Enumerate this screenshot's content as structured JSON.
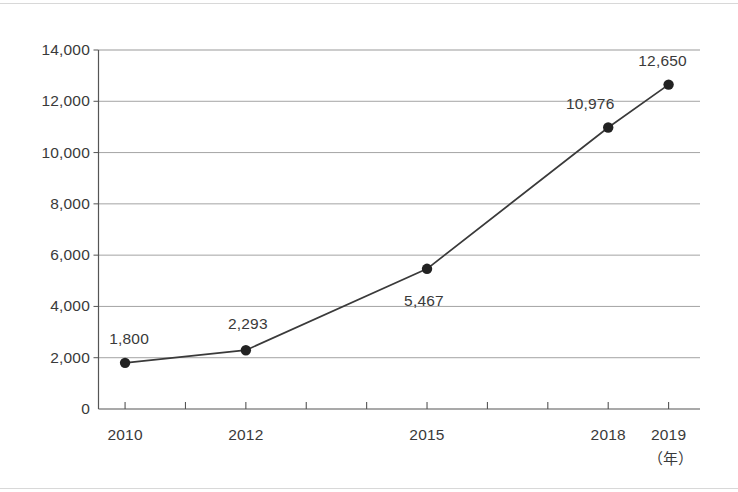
{
  "chart_data": {
    "type": "line",
    "title": "",
    "subtitle": "",
    "xlabel": "（年）",
    "ylabel": "",
    "x": [
      2010,
      2012,
      2015,
      2018,
      2019
    ],
    "values": [
      1800,
      2293,
      5467,
      10976,
      12650
    ],
    "point_labels": [
      "1,800",
      "2,293",
      "5,467",
      "10,976",
      "12,650"
    ],
    "categories": [
      "2010",
      "2012",
      "2015",
      "2018",
      "2019"
    ],
    "xlim": [
      2009.56,
      2019.52
    ],
    "ylim": [
      0,
      14000
    ],
    "xticks": [
      2010,
      2011,
      2012,
      2013,
      2014,
      2015,
      2016,
      2017,
      2018,
      2019
    ],
    "xtick_labels_shown": [
      "2010",
      "2012",
      "2015",
      "2018",
      "2019"
    ],
    "yticks": [
      0,
      2000,
      4000,
      6000,
      8000,
      10000,
      12000,
      14000
    ],
    "ytick_labels": [
      "0",
      "2,000",
      "4,000",
      "6,000",
      "8,000",
      "10,000",
      "12,000",
      "14,000"
    ],
    "grid": "horizontal",
    "legend": "none",
    "marker": "filled-circle",
    "line_color": "#3a3a3a",
    "marker_color": "#222222",
    "grid_color": "#9a9a9a",
    "axis_color": "#555555",
    "text_color": "#3a3a3a",
    "background": "#ffffff"
  },
  "axis": {
    "y_labels": [
      {
        "value": 14000,
        "text": "14,000"
      },
      {
        "value": 12000,
        "text": "12,000"
      },
      {
        "value": 10000,
        "text": "10,000"
      },
      {
        "value": 8000,
        "text": "8,000"
      },
      {
        "value": 6000,
        "text": "6,000"
      },
      {
        "value": 4000,
        "text": "4,000"
      },
      {
        "value": 2000,
        "text": "2,000"
      },
      {
        "value": 0,
        "text": "0"
      }
    ],
    "x_labels": [
      {
        "value": 2010,
        "text": "2010"
      },
      {
        "value": 2012,
        "text": "2012"
      },
      {
        "value": 2015,
        "text": "2015"
      },
      {
        "value": 2018,
        "text": "2018"
      },
      {
        "value": 2019,
        "text": "2019"
      }
    ],
    "unit_label": "（年）"
  },
  "series_points": [
    {
      "x": 2010,
      "y": 1800,
      "label": "1,800",
      "label_dx": 4,
      "label_dy": -26
    },
    {
      "x": 2012,
      "y": 2293,
      "label": "2,293",
      "label_dx": 2,
      "label_dy": -28
    },
    {
      "x": 2015,
      "y": 5467,
      "label": "5,467",
      "label_dx": -3,
      "label_dy": 30
    },
    {
      "x": 2018,
      "y": 10976,
      "label": "10,976",
      "label_dx": -18,
      "label_dy": -26
    },
    {
      "x": 2019,
      "y": 12650,
      "label": "12,650",
      "label_dx": -6,
      "label_dy": -26
    }
  ]
}
